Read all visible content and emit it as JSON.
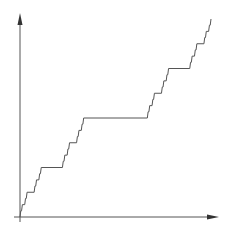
{
  "figure": {
    "colors": {
      "background": "#ffffff",
      "axis": "#555555",
      "curve": "#555555"
    }
  },
  "chart_data": {
    "type": "line",
    "title": "",
    "xlabel": "",
    "ylabel": "",
    "xlim": [
      0,
      1
    ],
    "ylim": [
      0,
      1
    ],
    "grid": false,
    "legend": [],
    "series": [
      {
        "name": "Cantor function",
        "recursion_depth": 5,
        "key_points": {
          "x": [
            0,
            0.1111,
            0.2222,
            0.3333,
            0.6667,
            0.7778,
            0.8889,
            1
          ],
          "y": [
            0,
            0.25,
            0.25,
            0.5,
            0.5,
            0.75,
            0.75,
            1
          ]
        }
      }
    ]
  },
  "plot_area": {
    "origin_px": [
      20,
      217
    ],
    "curve_end_px": [
      211,
      19
    ],
    "y_axis_top_px": 14,
    "x_axis_right_px": 218
  }
}
